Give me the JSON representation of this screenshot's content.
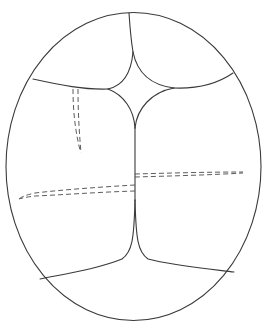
{
  "diagram": {
    "colors": {
      "background": "#ffffff",
      "line": "#3a3a3a",
      "dashed_line": "#4a4a4a"
    },
    "outline": {
      "shape": "ellipse",
      "cx": 133.5,
      "cy": 166.5,
      "rx": 127.5,
      "ry": 154
    },
    "solid_lines": [
      {
        "name": "top-suture",
        "d": "M129,13 C130,28 131,40 133,52"
      },
      {
        "name": "star-top-left-edge",
        "d": "M133,52 C131,75 122,86 108,89"
      },
      {
        "name": "star-top-right-edge",
        "d": "M133,52 C137,72 150,85 174,88"
      },
      {
        "name": "star-bottom-left-edge",
        "d": "M108,89 C124,95 134,110 135,128"
      },
      {
        "name": "star-bottom-right-edge",
        "d": "M174,88 C152,92 137,108 135,128"
      },
      {
        "name": "left-coronal-suture",
        "d": "M33,79 C60,85 85,90 108,89"
      },
      {
        "name": "right-coronal-suture",
        "d": "M174,88 C200,89 220,82 233,73"
      },
      {
        "name": "sagittal-suture",
        "d": "M135,128 L135,200"
      },
      {
        "name": "lower-left-branch",
        "d": "M135,200 C134,240 132,252 122,259 C100,268 70,273 40,279"
      },
      {
        "name": "lower-right-branch",
        "d": "M135,200 C136,240 138,252 148,259 C170,265 200,268 234,272"
      }
    ],
    "dashed_lines": [
      {
        "name": "left-short-trace-outer",
        "d": "M73,89 C73,110 75,130 80,150"
      },
      {
        "name": "left-short-trace-inner",
        "d": "M78,89 C78,110 79,130 81,153"
      },
      {
        "name": "right-horizontal-trace-top",
        "d": "M135,174 C170,173 210,172 243,172"
      },
      {
        "name": "right-horizontal-trace-bottom",
        "d": "M135,177 C170,176 210,175 243,173"
      },
      {
        "name": "left-long-trace-top",
        "d": "M135,185 C100,187 60,190 35,193 C26,195 21,197 19,199"
      },
      {
        "name": "left-long-trace-bottom",
        "d": "M135,191 C100,192 60,195 35,196 C27,197 22,198 19,199"
      }
    ]
  }
}
